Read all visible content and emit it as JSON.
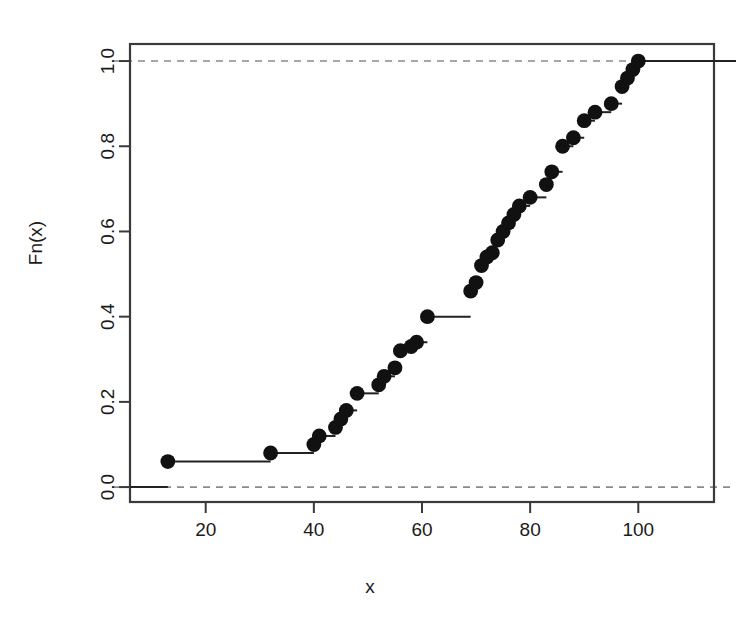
{
  "figure": {
    "title": "",
    "background_color": "#ffffff",
    "point_color": "#111111",
    "line_color": "#222222",
    "reference_line_color": "#8a8a8a",
    "axis_color": "#3a3a3a"
  },
  "chart_data": {
    "type": "line",
    "title": "",
    "subtitle": "",
    "xlabel": "x",
    "ylabel": "Fn(x)",
    "grid": false,
    "legend": null,
    "xlim": [
      6,
      114
    ],
    "ylim": [
      -0.035,
      1.04
    ],
    "xticks": [
      20,
      40,
      60,
      80,
      100
    ],
    "xticklabels": [
      "20",
      "40",
      "60",
      "80",
      "100"
    ],
    "yticks": [
      0.0,
      0.2,
      0.4,
      0.6,
      0.8,
      1.0
    ],
    "yticklabels": [
      "0.0",
      "0.2",
      "0.4",
      "0.6",
      "0.8",
      "1.0"
    ],
    "annotations": [
      {
        "kind": "reference-line",
        "orientation": "horizontal",
        "value": 0.0,
        "style": "dashed"
      },
      {
        "kind": "reference-line",
        "orientation": "horizontal",
        "value": 1.0,
        "style": "dashed"
      }
    ],
    "series": [
      {
        "name": "Fn(x)",
        "marker": "filled-circle",
        "step_style": "post",
        "x": [
          13,
          32,
          40,
          41,
          44,
          45,
          46,
          48,
          52,
          53,
          55,
          56,
          58,
          59,
          61,
          69,
          70,
          71,
          72,
          73,
          74,
          75,
          76,
          77,
          78,
          80,
          83,
          84,
          86,
          88,
          90,
          92,
          95,
          97,
          98,
          99,
          100
        ],
        "y": [
          0.06,
          0.08,
          0.1,
          0.12,
          0.14,
          0.16,
          0.18,
          0.22,
          0.24,
          0.26,
          0.28,
          0.32,
          0.33,
          0.34,
          0.4,
          0.46,
          0.48,
          0.52,
          0.54,
          0.55,
          0.58,
          0.6,
          0.62,
          0.64,
          0.66,
          0.68,
          0.71,
          0.74,
          0.8,
          0.82,
          0.86,
          0.88,
          0.9,
          0.94,
          0.96,
          0.98,
          1.0
        ]
      }
    ]
  }
}
